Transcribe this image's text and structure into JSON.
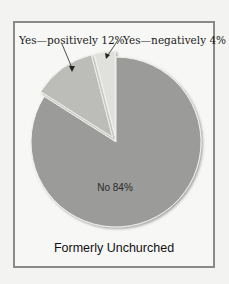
{
  "chart_data": {
    "type": "pie",
    "title": "Formerly Unchurched",
    "slices": [
      {
        "label": "No",
        "value": 84,
        "display": "No 84%",
        "color": "#9b9b99",
        "exploded": false
      },
      {
        "label": "Yes—positively",
        "value": 12,
        "display": "Yes—positively 12%",
        "color": "#bcbcb8",
        "exploded": true
      },
      {
        "label": "Yes—negatively",
        "value": 4,
        "display": "Yes—negatively 4%",
        "color": "#e0e0dc",
        "exploded": true
      }
    ],
    "legend": "none",
    "annotations": [
      "Yes—positively 12%",
      "Yes—negatively 4%",
      "No 84%"
    ]
  },
  "labels": {
    "positively": "Yes—positively 12%",
    "negatively": "Yes—negatively 4%",
    "no": "No 84%",
    "title": "Formerly Unchurched"
  }
}
